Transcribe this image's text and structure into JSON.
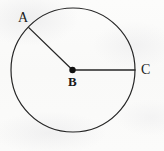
{
  "figure": {
    "kind": "geometry-diagram",
    "canvas": {
      "width": 164,
      "height": 151
    },
    "background_color": "#fbfbfa",
    "ink_color": "#1b1b1b"
  },
  "shapes": {
    "circle": {
      "name": "circle-outline",
      "center_x": 73,
      "center_y": 70,
      "radius": 62,
      "stroke_color": "#262626",
      "stroke_width": 1.2,
      "fill": "none"
    },
    "center_dot": {
      "name": "center-point-b",
      "x": 72.5,
      "y": 70,
      "radius": 3.2,
      "fill_color": "#111111"
    },
    "radii": [
      {
        "name": "radius-b-to-a",
        "x1": 72.5,
        "y1": 70,
        "x2": 28.8,
        "y2": 27.6,
        "stroke_color": "#262626",
        "stroke_width": 1.3
      },
      {
        "name": "radius-b-to-c",
        "x1": 72.5,
        "y1": 70,
        "x2": 135,
        "y2": 70,
        "stroke_color": "#262626",
        "stroke_width": 1.3
      }
    ]
  },
  "labels": [
    {
      "id": "label-a",
      "text": "A",
      "x": 18,
      "y": 11,
      "font_size": 14,
      "weight": "plain"
    },
    {
      "id": "label-b",
      "text": "B",
      "x": 68,
      "y": 75,
      "font_size": 13,
      "weight": "bold"
    },
    {
      "id": "label-c",
      "text": "C",
      "x": 141,
      "y": 63,
      "font_size": 14,
      "weight": "plain"
    }
  ]
}
